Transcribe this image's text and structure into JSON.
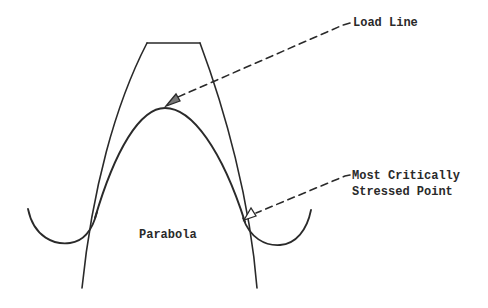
{
  "diagram": {
    "labels": {
      "load_line": "Load Line",
      "critical_point_line1": "Most Critically",
      "critical_point_line2": "Stressed Point",
      "parabola": "Parabola"
    },
    "colors": {
      "stroke": "#2a2a2a",
      "background": "#ffffff"
    }
  }
}
